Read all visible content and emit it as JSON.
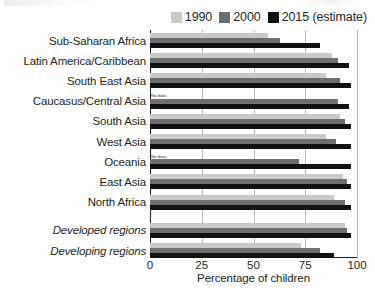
{
  "legend": {
    "items": [
      {
        "label": "1990",
        "color": "#c9c9c9"
      },
      {
        "label": "2000",
        "color": "#6e6e6e"
      },
      {
        "label": "2015 (estimate)",
        "color": "#111111"
      }
    ]
  },
  "axis": {
    "x_title": "Percentage of children",
    "x_ticks": [
      "0",
      "25",
      "50",
      "75",
      "100"
    ],
    "x_min": 0,
    "x_max": 100
  },
  "labels": {
    "no_data": "No data"
  },
  "chart_data": {
    "type": "bar",
    "orientation": "horizontal",
    "title": "",
    "xlabel": "Percentage of children",
    "ylabel": "",
    "xlim": [
      0,
      100
    ],
    "grid": true,
    "legend_position": "top-right",
    "categories": [
      "Sub-Saharan Africa",
      "Latin America/Caribbean",
      "South East Asia",
      "Caucasus/Central Asia",
      "South Asia",
      "West Asia",
      "Oceania",
      "East Asia",
      "North Africa",
      "Developed regions",
      "Developing regions"
    ],
    "italic_categories": [
      "Developed regions",
      "Developing regions"
    ],
    "series": [
      {
        "name": "1990",
        "color": "#c9c9c9",
        "values": [
          57,
          88,
          85,
          null,
          92,
          85,
          null,
          93,
          89,
          94,
          73
        ]
      },
      {
        "name": "2000",
        "color": "#6e6e6e",
        "values": [
          63,
          91,
          92,
          91,
          94,
          90,
          72,
          95,
          94,
          95,
          82
        ]
      },
      {
        "name": "2015 (estimate)",
        "color": "#111111",
        "values": [
          82,
          96,
          97,
          96,
          97,
          97,
          97,
          97,
          97,
          97,
          89
        ]
      }
    ],
    "missing_note": "No data"
  }
}
